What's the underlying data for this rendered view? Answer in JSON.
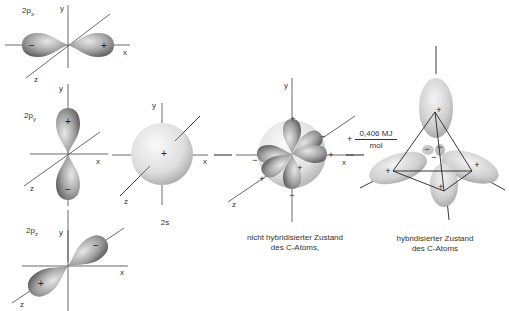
{
  "panels": {
    "px": {
      "label_main": "2p",
      "label_sub": "x",
      "axis_x": "x",
      "axis_y": "y",
      "axis_z": "z",
      "sign_left": "−",
      "sign_right": "+"
    },
    "py": {
      "label_main": "2p",
      "label_sub": "y",
      "axis_x": "x",
      "axis_y": "y",
      "axis_z": "z",
      "sign_top": "+",
      "sign_bottom": "−"
    },
    "pz": {
      "label_main": "2p",
      "label_sub": "z",
      "axis_x": "x",
      "axis_y": "y",
      "axis_z": "z",
      "sign_back": "−",
      "sign_front": "+"
    },
    "s": {
      "caption": "2s",
      "axis_x": "x",
      "axis_y": "y",
      "axis_z": "z",
      "sign": "+"
    },
    "unhybridized": {
      "caption_line1": "nicht hybridisierter Zustand",
      "caption_line2": "des C-Atoms,",
      "axis_x": "x",
      "axis_y": "y",
      "axis_z": "z"
    },
    "energy": {
      "prefix": "+",
      "numerator": "0,406 MJ",
      "denominator": "mol"
    },
    "hybridized": {
      "caption_line1": "hybridisierter Zustand",
      "caption_line2": "des C-Atoms"
    }
  },
  "colors": {
    "background": "#ffffff",
    "axis": "#333333",
    "lobe_dark": "#6e6e6e",
    "lobe_mid": "#a8a8a8",
    "lobe_light": "#e6e6e6",
    "sphere_light": "#f2f2f2",
    "sphere_dark": "#bdbdbd"
  }
}
